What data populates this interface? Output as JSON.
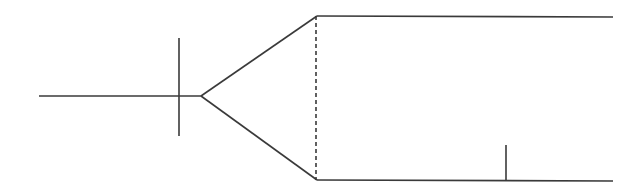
{
  "diagram": {
    "width": 644,
    "height": 190,
    "background": "#ffffff",
    "stroke_color": "#3a3a3a",
    "stroke_width": 1.6,
    "dash_pattern": "4,3",
    "segments": [
      {
        "id": "left-axis-line",
        "x1": 39,
        "y1": 96,
        "x2": 201,
        "y2": 96,
        "style": "solid"
      },
      {
        "id": "vertical-marker",
        "x1": 179,
        "y1": 38,
        "x2": 179,
        "y2": 136,
        "style": "solid"
      },
      {
        "id": "upper-diagonal",
        "x1": 201,
        "y1": 96,
        "x2": 317,
        "y2": 16,
        "style": "solid"
      },
      {
        "id": "lower-diagonal",
        "x1": 201,
        "y1": 96,
        "x2": 317,
        "y2": 180,
        "style": "solid"
      },
      {
        "id": "dashed-divider",
        "x1": 316,
        "y1": 16,
        "x2": 316,
        "y2": 180,
        "style": "dashed"
      },
      {
        "id": "top-rail",
        "x1": 317,
        "y1": 16,
        "x2": 613,
        "y2": 17,
        "style": "solid"
      },
      {
        "id": "bottom-rail",
        "x1": 317,
        "y1": 180,
        "x2": 613,
        "y2": 181,
        "style": "solid"
      },
      {
        "id": "bottom-tick",
        "x1": 506,
        "y1": 145,
        "x2": 506,
        "y2": 181,
        "style": "solid"
      }
    ]
  }
}
